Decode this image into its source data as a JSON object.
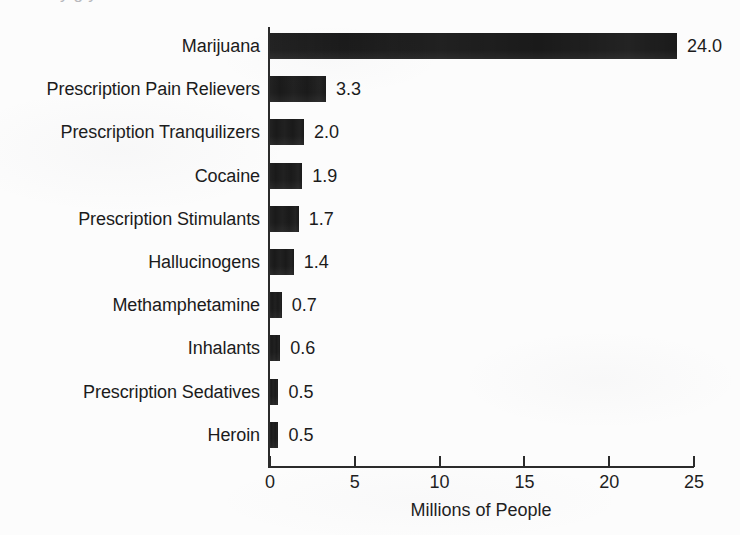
{
  "page": {
    "background_color": "#fcfcfc",
    "ink_color": "#1a1a1a",
    "top_text_remnant": "y                                                                                                     g  y"
  },
  "chart_data": {
    "type": "bar",
    "orientation": "horizontal",
    "title": "",
    "subtitle": "",
    "xlabel": "Millions of People",
    "ylabel": "",
    "xlim": [
      0,
      25
    ],
    "xticks": [
      0,
      5,
      10,
      15,
      20,
      25
    ],
    "xtick_labels": [
      "0",
      "5",
      "10",
      "15",
      "20",
      "25"
    ],
    "grid": false,
    "legend": null,
    "bar_color": "#1a1a1a",
    "categories": [
      "Marijuana",
      "Prescription Pain Relievers",
      "Prescription Tranquilizers",
      "Cocaine",
      "Prescription Stimulants",
      "Hallucinogens",
      "Methamphetamine",
      "Inhalants",
      "Prescription Sedatives",
      "Heroin"
    ],
    "values": [
      24.0,
      3.3,
      2.0,
      1.9,
      1.7,
      1.4,
      0.7,
      0.6,
      0.5,
      0.5
    ],
    "value_labels": [
      "24.0",
      "3.3",
      "2.0",
      "1.9",
      "1.7",
      "1.4",
      "0.7",
      "0.6",
      "0.5",
      "0.5"
    ]
  }
}
